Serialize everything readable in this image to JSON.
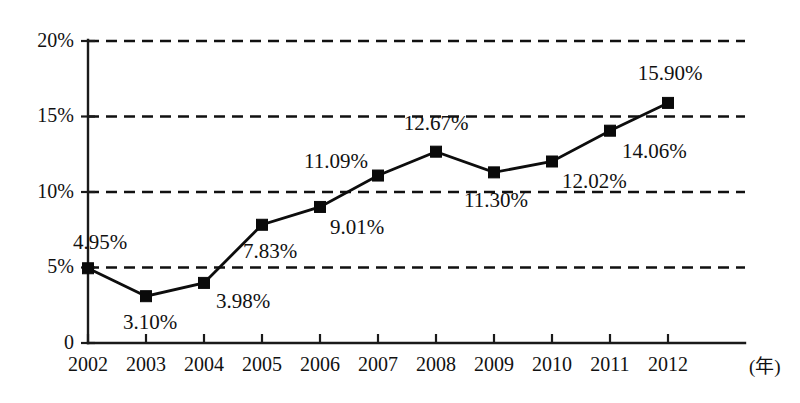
{
  "chart_data": {
    "type": "line",
    "title": "",
    "subtitle": "",
    "xlabel": "(年)",
    "ylabel": "",
    "categories": [
      "2002",
      "2003",
      "2004",
      "2005",
      "2006",
      "2007",
      "2008",
      "2009",
      "2010",
      "2011",
      "2012"
    ],
    "values": [
      4.95,
      3.1,
      3.98,
      7.83,
      9.01,
      11.09,
      12.67,
      11.3,
      12.02,
      14.06,
      15.9
    ],
    "point_labels": [
      "4.95%",
      "3.10%",
      "3.98%",
      "7.83%",
      "9.01%",
      "11.09%",
      "12.67%",
      "11.30%",
      "12.02%",
      "14.06%",
      "15.90%"
    ],
    "ylim": [
      0,
      20
    ],
    "yticks": [
      0,
      5,
      10,
      15,
      20
    ],
    "ytick_labels": [
      "0",
      "5%",
      "10%",
      "15%",
      "20%"
    ],
    "grid": "horizontal-dashed",
    "legend": "none",
    "marker": "filled-square",
    "line_color": "#0d0d0d",
    "marker_color": "#0a0a0a",
    "grid_color": "#111111",
    "axis_color": "#1a1a1a",
    "background_color": "#ffffff",
    "series": [
      {
        "name": "",
        "values": [
          4.95,
          3.1,
          3.98,
          7.83,
          9.01,
          11.09,
          12.67,
          11.3,
          12.02,
          14.06,
          15.9
        ]
      }
    ],
    "label_placement": [
      {
        "category": "2002",
        "label": "4.95%",
        "anchor": "middle",
        "dx": 12,
        "dy": -24
      },
      {
        "category": "2003",
        "label": "3.10%",
        "anchor": "middle",
        "dx": 4,
        "dy": 28
      },
      {
        "category": "2004",
        "label": "3.98%",
        "anchor": "start",
        "dx": 12,
        "dy": 20
      },
      {
        "category": "2005",
        "label": "7.83%",
        "anchor": "middle",
        "dx": 8,
        "dy": 28
      },
      {
        "category": "2006",
        "label": "9.01%",
        "anchor": "start",
        "dx": 10,
        "dy": 22
      },
      {
        "category": "2007",
        "label": "11.09%",
        "anchor": "end",
        "dx": -10,
        "dy": -12
      },
      {
        "category": "2008",
        "label": "12.67%",
        "anchor": "middle",
        "dx": 0,
        "dy": -26
      },
      {
        "category": "2009",
        "label": "11.30%",
        "anchor": "middle",
        "dx": 2,
        "dy": 30
      },
      {
        "category": "2010",
        "label": "12.02%",
        "anchor": "start",
        "dx": 10,
        "dy": 22
      },
      {
        "category": "2011",
        "label": "14.06%",
        "anchor": "start",
        "dx": 12,
        "dy": 22
      },
      {
        "category": "2012",
        "label": "15.90%",
        "anchor": "middle",
        "dx": 2,
        "dy": -28
      }
    ]
  }
}
